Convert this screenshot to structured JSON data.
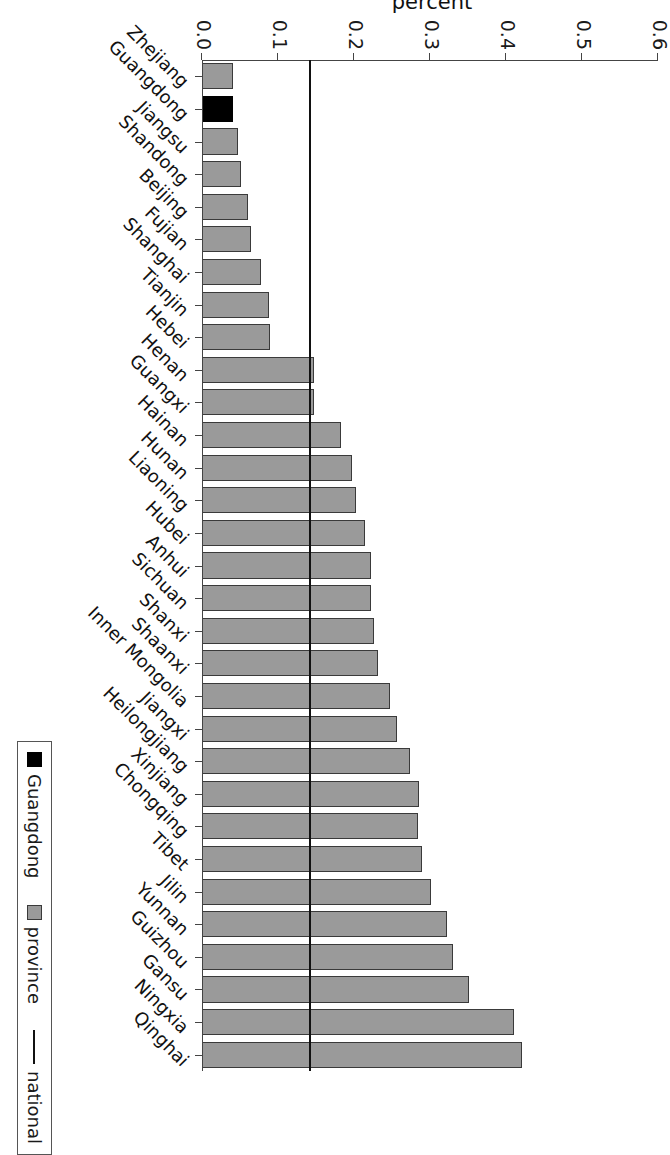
{
  "chart_data": {
    "type": "bar",
    "orientation": "horizontal",
    "title": "",
    "xlabel": "",
    "ylabel": "percent",
    "ylim": [
      0.0,
      0.6
    ],
    "yticks": [
      "0.0",
      "0.1",
      "0.2",
      "0.3",
      "0.4",
      "0.5",
      "0.6"
    ],
    "ytick_values": [
      0.0,
      0.1,
      0.2,
      0.3,
      0.4,
      0.5,
      0.6
    ],
    "grid": false,
    "legend_position": "bottom-right",
    "categories": [
      "Zhejiang",
      "Guangdong",
      "Jiangsu",
      "Shandong",
      "Beijing",
      "Fujian",
      "Shanghai",
      "Tianjin",
      "Hebei",
      "Henan",
      "Guangxi",
      "Hainan",
      "Hunan",
      "Liaoning",
      "Hubei",
      "Anhui",
      "Sichuan",
      "Shanxi",
      "Shaanxi",
      "Inner Mongolia",
      "Jiangxi",
      "Heilongjiang",
      "Xinjiang",
      "Chongqing",
      "Tibet",
      "Jilin",
      "Yunnan",
      "Guizhou",
      "Gansu",
      "Ningxia",
      "Qinghai"
    ],
    "values": [
      0.041,
      0.041,
      0.047,
      0.051,
      0.06,
      0.064,
      0.078,
      0.088,
      0.089,
      0.147,
      0.148,
      0.183,
      0.198,
      0.202,
      0.214,
      0.222,
      0.222,
      0.226,
      0.232,
      0.248,
      0.256,
      0.274,
      0.285,
      0.284,
      0.29,
      0.301,
      0.322,
      0.33,
      0.351,
      0.41,
      0.421
    ],
    "bar_colors": [
      "province",
      "Guangdong",
      "province",
      "province",
      "province",
      "province",
      "province",
      "province",
      "province",
      "province",
      "province",
      "province",
      "province",
      "province",
      "province",
      "province",
      "province",
      "province",
      "province",
      "province",
      "province",
      "province",
      "province",
      "province",
      "province",
      "province",
      "province",
      "province",
      "province",
      "province",
      "province"
    ],
    "reference_line": {
      "name": "national",
      "value": 0.143
    },
    "colors": {
      "highlight": "#000000",
      "province": "#9a9a9a",
      "national": "#111111"
    }
  },
  "legend": {
    "items": [
      {
        "label": "Guangdong",
        "marker": "black-square"
      },
      {
        "label": "province",
        "marker": "grey-square"
      },
      {
        "label": "national",
        "marker": "line"
      }
    ]
  },
  "axis": {
    "y_title": "percent"
  }
}
